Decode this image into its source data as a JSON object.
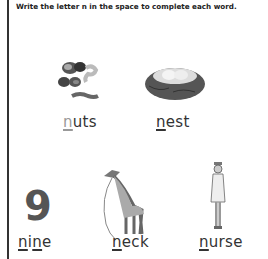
{
  "instruction": "Write the letter n in the space to complete each word.",
  "items": [
    {
      "word": "nuts",
      "parts": [
        "n",
        "uts"
      ],
      "picture": "nuts-picture"
    },
    {
      "word": "nest",
      "parts": [
        "n",
        "est"
      ],
      "picture": "nest-picture"
    },
    {
      "word": "nine",
      "parts": [
        "n",
        "i",
        "n",
        "e"
      ],
      "picture": "number-nine-picture"
    },
    {
      "word": "neck",
      "parts": [
        "n",
        "eck"
      ],
      "picture": "giraffe-picture"
    },
    {
      "word": "nurse",
      "parts": [
        "n",
        "urse"
      ],
      "picture": "nurse-picture"
    }
  ],
  "number_nine": "9"
}
